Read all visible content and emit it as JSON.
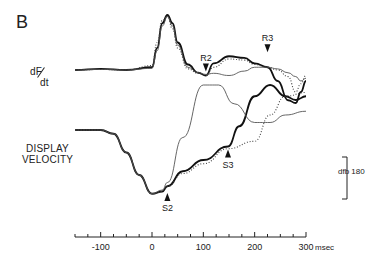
{
  "panel_label": "B",
  "labels": {
    "dfdt_num": "dF",
    "dfdt_den": "dt",
    "display_velocity_line1": "DISPLAY",
    "display_velocity_line2": "VELOCITY",
    "dfb": "dfb 180",
    "unit": "msec"
  },
  "chart_data": {
    "type": "line",
    "title": "",
    "xlabel": "msec",
    "ylabel": [
      "dF/dt",
      "DISPLAY VELOCITY"
    ],
    "xlim": [
      -150,
      310
    ],
    "x_ticks": [
      -100,
      0,
      100,
      200,
      300
    ],
    "x_tick_labels": [
      "-100",
      "0",
      "100",
      "200",
      "300 msec"
    ],
    "minor_tick_step": 25,
    "grid": false,
    "annotations": [
      {
        "label": "R2",
        "x": 105,
        "panel": "dF/dt"
      },
      {
        "label": "R3",
        "x": 225,
        "panel": "dF/dt"
      },
      {
        "label": "S2",
        "x": 30,
        "panel": "display velocity"
      },
      {
        "label": "S3",
        "x": 148,
        "panel": "display velocity"
      },
      {
        "label": "dfb 180",
        "panel": "display velocity",
        "note": "trace label"
      }
    ],
    "scale_bar": "vertical bar at right of velocity panel (unlabeled)",
    "panels": [
      {
        "name": "dF/dt",
        "series": [
          {
            "name": "thick",
            "x": [
              -150,
              -100,
              -50,
              0,
              10,
              20,
              30,
              40,
              50,
              70,
              90,
              105,
              120,
              150,
              180,
              200,
              225,
              245,
              265,
              280,
              290,
              300
            ],
            "y": [
              0,
              0.02,
              0,
              0.05,
              0.4,
              0.85,
              1.0,
              0.85,
              0.5,
              0.1,
              -0.05,
              -0.1,
              0.12,
              0.25,
              0.22,
              0.12,
              0.05,
              -0.2,
              -0.55,
              -0.6,
              -0.4,
              -0.2
            ]
          },
          {
            "name": "thin",
            "x": [
              -150,
              -100,
              -50,
              0,
              10,
              20,
              30,
              40,
              50,
              70,
              90,
              105,
              120,
              150,
              180,
              200,
              225,
              245,
              265,
              280,
              290,
              300
            ],
            "y": [
              0,
              0.01,
              0,
              0.03,
              0.35,
              0.8,
              0.97,
              0.8,
              0.45,
              0.05,
              -0.05,
              -0.08,
              -0.06,
              -0.1,
              -0.02,
              0.05,
              0.05,
              0.02,
              -0.05,
              -0.12,
              -0.2,
              -0.15
            ]
          },
          {
            "name": "dotted",
            "x": [
              -150,
              -100,
              -50,
              0,
              10,
              20,
              30,
              40,
              50,
              70,
              90,
              105,
              120,
              150,
              180,
              200,
              225,
              245,
              265,
              280,
              290,
              300
            ],
            "y": [
              0,
              0.01,
              0,
              0.08,
              0.5,
              0.9,
              0.98,
              0.75,
              0.4,
              0.02,
              -0.06,
              -0.1,
              0.05,
              0.2,
              0.18,
              0.1,
              0.05,
              0.0,
              -0.12,
              -0.4,
              -0.25,
              -0.1
            ]
          }
        ]
      },
      {
        "name": "display velocity",
        "series": [
          {
            "name": "thick",
            "x": [
              -150,
              -100,
              -75,
              -50,
              -25,
              0,
              20,
              30,
              60,
              100,
              148,
              170,
              200,
              230,
              260,
              280,
              300
            ],
            "y": [
              0,
              0,
              -0.05,
              -0.3,
              -0.6,
              -0.85,
              -0.82,
              -0.75,
              -0.55,
              -0.4,
              -0.22,
              0.05,
              0.45,
              0.6,
              0.45,
              0.4,
              0.45
            ]
          },
          {
            "name": "thin",
            "x": [
              -150,
              -100,
              -75,
              -50,
              -25,
              0,
              20,
              30,
              60,
              100,
              130,
              160,
              200,
              230,
              260,
              300
            ],
            "y": [
              0,
              0,
              -0.05,
              -0.3,
              -0.6,
              -0.85,
              -0.8,
              -0.7,
              -0.1,
              0.6,
              0.6,
              0.35,
              0.1,
              0.1,
              0.2,
              0.25
            ]
          },
          {
            "name": "dotted",
            "x": [
              -150,
              -100,
              -75,
              -50,
              -25,
              0,
              20,
              30,
              60,
              100,
              148,
              200,
              230,
              260,
              300
            ],
            "y": [
              0,
              0,
              -0.05,
              -0.3,
              -0.6,
              -0.85,
              -0.82,
              -0.75,
              -0.58,
              -0.45,
              -0.25,
              -0.15,
              0.2,
              0.45,
              0.5
            ]
          }
        ]
      }
    ]
  }
}
